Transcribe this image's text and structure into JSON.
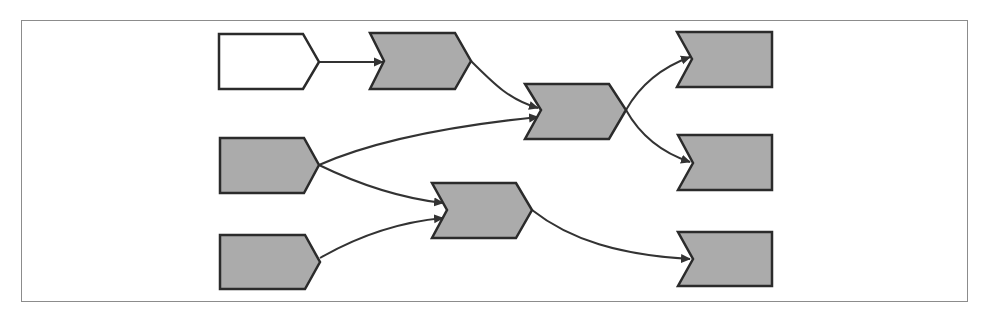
{
  "diagram": {
    "type": "flow",
    "colors": {
      "frame": "#8c8c8c",
      "stroke": "#2b2b2b",
      "fill_gray": "#ababab",
      "fill_white": "#ffffff",
      "arrow": "#333333"
    },
    "nodes": [
      {
        "id": "n1",
        "shape": "pentagon",
        "fill": "white",
        "label": ""
      },
      {
        "id": "n2",
        "shape": "chevron",
        "fill": "gray",
        "label": ""
      },
      {
        "id": "n3",
        "shape": "pentagon",
        "fill": "gray",
        "label": ""
      },
      {
        "id": "n4",
        "shape": "pentagon",
        "fill": "gray",
        "label": ""
      },
      {
        "id": "n5",
        "shape": "chevron",
        "fill": "gray",
        "label": ""
      },
      {
        "id": "n6",
        "shape": "chevron",
        "fill": "gray",
        "label": ""
      },
      {
        "id": "n7",
        "shape": "notched-rect",
        "fill": "gray",
        "label": ""
      },
      {
        "id": "n8",
        "shape": "notched-rect",
        "fill": "gray",
        "label": ""
      },
      {
        "id": "n9",
        "shape": "notched-rect",
        "fill": "gray",
        "label": ""
      }
    ],
    "edges": [
      {
        "from": "n1",
        "to": "n2"
      },
      {
        "from": "n2",
        "to": "n5"
      },
      {
        "from": "n3",
        "to": "n5"
      },
      {
        "from": "n3",
        "to": "n6"
      },
      {
        "from": "n4",
        "to": "n6"
      },
      {
        "from": "n5",
        "to": "n7"
      },
      {
        "from": "n5",
        "to": "n8"
      },
      {
        "from": "n6",
        "to": "n9"
      }
    ]
  }
}
